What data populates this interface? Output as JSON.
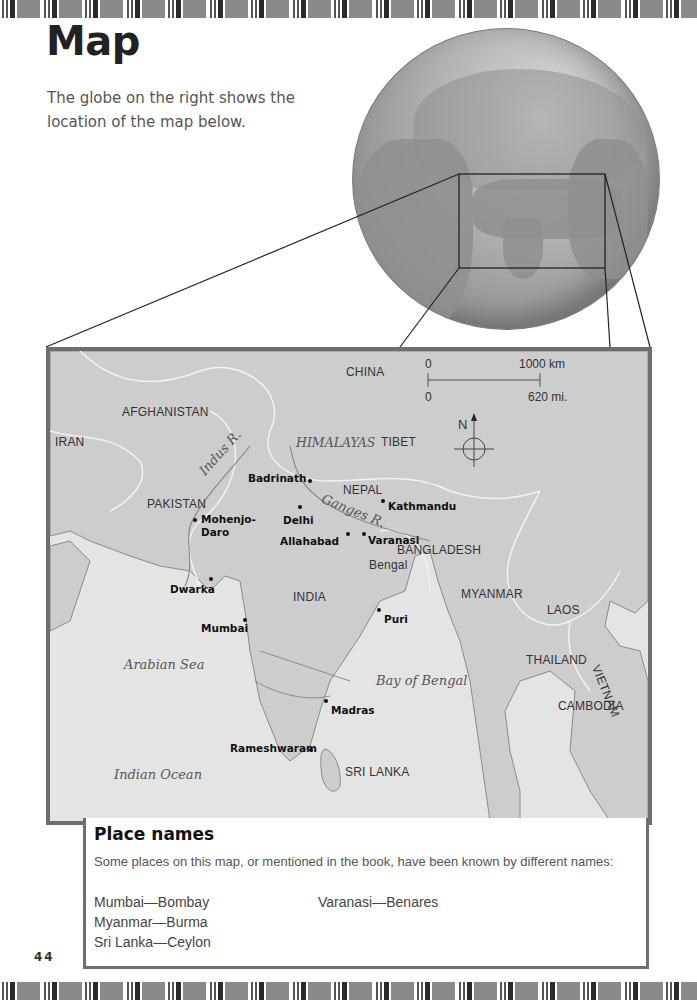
{
  "page": {
    "title": "Map",
    "intro": "The globe on the right shows the location of the map below.",
    "page_number": "44"
  },
  "globe": {
    "description": "globe-showing-asia-with-highlighted-region"
  },
  "map": {
    "countries": {
      "china": "CHINA",
      "afghanistan": "AFGHANISTAN",
      "iran": "IRAN",
      "tibet": "TIBET",
      "pakistan": "PAKISTAN",
      "nepal": "NEPAL",
      "bangladesh": "BANGLADESH",
      "india": "INDIA",
      "myanmar": "MYANMAR",
      "laos": "LAOS",
      "thailand": "THAILAND",
      "vietnam": "VIETNAM",
      "cambodia": "CAMBODIA",
      "sri_lanka": "SRI LANKA"
    },
    "regions": {
      "bengal": "Bengal"
    },
    "physical": {
      "himalayas": "HIMALAYAS",
      "indus": "Indus R.",
      "ganges": "Ganges R.",
      "arabian_sea": "Arabian Sea",
      "bay_of_bengal": "Bay of Bengal",
      "indian_ocean": "Indian Ocean"
    },
    "cities": {
      "badrinath": "Badrinath",
      "mohenjo1": "Mohenjo-",
      "mohenjo2": "Daro",
      "delhi": "Delhi",
      "kathmandu": "Kathmandu",
      "allahabad": "Allahabad",
      "varanasi": "Varanasi",
      "dwarka": "Dwarka",
      "mumbai": "Mumbai",
      "puri": "Puri",
      "madras": "Madras",
      "rameshwaram": "Rameshwaram"
    },
    "scale": {
      "km_start": "0",
      "km_end": "1000 km",
      "mi_start": "0",
      "mi_end": "620 mi."
    },
    "compass": {
      "north": "N"
    }
  },
  "place_names": {
    "title": "Place names",
    "description": "Some places on this map, or mentioned in the book, have been known by different names:",
    "pairs": [
      "Mumbai—Bombay",
      "Myanmar—Burma",
      "Sri Lanka—Ceylon",
      "Varanasi—Benares"
    ]
  }
}
